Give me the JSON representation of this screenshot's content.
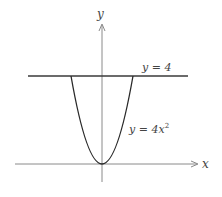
{
  "diagram": {
    "colors": {
      "axes": "#8a8a8a",
      "curve": "#2a2a2a",
      "line": "#3a3a3a",
      "text": "#444444"
    },
    "axes": {
      "x_label": "x",
      "y_label": "y"
    },
    "curves": [
      {
        "id": "parabola",
        "equation": "y = 4x^2",
        "label_main": "y = 4x",
        "label_exp": "2"
      },
      {
        "id": "horizontal-line",
        "equation": "y = 4",
        "label": "y = 4"
      }
    ],
    "intersections": [
      {
        "x": -1,
        "y": 4
      },
      {
        "x": 1,
        "y": 4
      }
    ]
  }
}
